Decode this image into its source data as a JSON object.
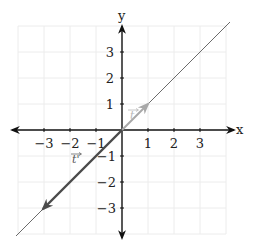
{
  "diagram": {
    "type": "coordinate-plane-vectors",
    "axes": {
      "x_label": "x",
      "y_label": "y",
      "x_ticks": [
        "−3",
        "−2",
        "−1",
        "1",
        "2",
        "3"
      ],
      "y_ticks": [
        "3",
        "2",
        "1",
        "−1",
        "−2",
        "−3"
      ],
      "x_tick_values": [
        -3,
        -2,
        -1,
        1,
        2,
        3
      ],
      "y_tick_values": [
        3,
        2,
        1,
        -1,
        -2,
        -3
      ],
      "range": [
        -4,
        4
      ]
    },
    "line": {
      "description": "line through origin with slope 1",
      "color": "#6b6b6b"
    },
    "vectors": [
      {
        "name": "t",
        "label": "t",
        "from": [
          0,
          0
        ],
        "to": [
          1,
          1
        ],
        "color": "#a8a8a8"
      },
      {
        "name": "t-prime",
        "label": "t'",
        "from": [
          0,
          0
        ],
        "to": [
          -3,
          -3
        ],
        "color": "#4a4a4a"
      }
    ],
    "colors": {
      "axis": "#111111",
      "grid": "#ececec",
      "line": "#6b6b6b",
      "vector_t": "#a8a8a8",
      "vector_t_prime": "#4a4a4a"
    }
  }
}
